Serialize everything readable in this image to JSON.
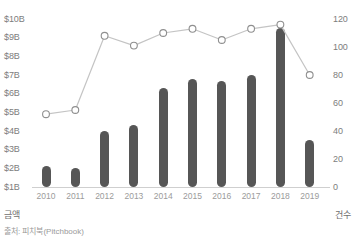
{
  "chart_data": {
    "type": "bar",
    "title": "",
    "subtitle": "",
    "categories": [
      "2010",
      "2011",
      "2012",
      "2013",
      "2014",
      "2015",
      "2016",
      "2017",
      "2018",
      "2019"
    ],
    "series": [
      {
        "name": "금액",
        "type": "bar",
        "axis": "left",
        "unit": "B",
        "values": [
          2.1,
          2.0,
          4.0,
          4.3,
          6.3,
          6.8,
          6.7,
          7.0,
          9.5,
          3.5
        ]
      },
      {
        "name": "건수",
        "type": "line",
        "axis": "right",
        "values": [
          52,
          55,
          108,
          101,
          110,
          113,
          105,
          113,
          116,
          80
        ]
      }
    ],
    "left_axis": {
      "label": "금액",
      "ticks": [
        "$10B",
        "$9B",
        "$8B",
        "$7B",
        "$6B",
        "$5B",
        "$4B",
        "$3B",
        "$2B",
        "$1B"
      ],
      "tick_values": [
        10,
        9,
        8,
        7,
        6,
        5,
        4,
        3,
        2,
        1
      ],
      "min": 1,
      "max": 10
    },
    "right_axis": {
      "label": "건수",
      "ticks": [
        "120",
        "100",
        "80",
        "60",
        "40",
        "20",
        "0"
      ],
      "tick_values": [
        120,
        100,
        80,
        60,
        40,
        20,
        0
      ],
      "min": 0,
      "max": 120
    },
    "xlabel": "",
    "grid": false,
    "legend": "none",
    "source": "출처: 피치북(Pitchbook)",
    "colors": {
      "bar": "#565656",
      "line": "#c4c4c4",
      "marker_fill": "#ffffff",
      "marker_stroke": "#8f8f8f",
      "axis": "#cfcfcf",
      "text": "#7d7d7d"
    }
  }
}
